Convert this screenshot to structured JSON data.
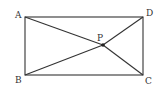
{
  "diagram": {
    "type": "geometry",
    "stroke_color": "#333333",
    "points": {
      "A": {
        "label": "A",
        "x": 25,
        "y": 17
      },
      "B": {
        "label": "B",
        "x": 25,
        "y": 75
      },
      "C": {
        "label": "C",
        "x": 143,
        "y": 75
      },
      "D": {
        "label": "D",
        "x": 143,
        "y": 17
      },
      "P": {
        "label": "P",
        "x": 103,
        "y": 45
      }
    },
    "segments": [
      [
        "A",
        "D"
      ],
      [
        "D",
        "C"
      ],
      [
        "C",
        "B"
      ],
      [
        "B",
        "A"
      ],
      [
        "A",
        "P"
      ],
      [
        "P",
        "C"
      ],
      [
        "B",
        "P"
      ],
      [
        "P",
        "D"
      ]
    ]
  }
}
